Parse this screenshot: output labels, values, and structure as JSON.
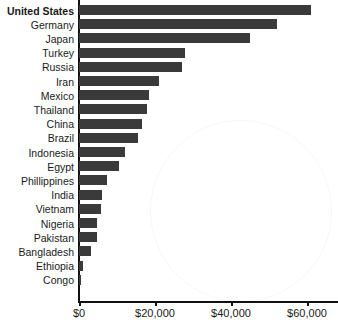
{
  "chart_data": {
    "type": "bar",
    "orientation": "horizontal",
    "title": "",
    "xlabel": "",
    "ylabel": "",
    "xlim": [
      0,
      65000
    ],
    "grid": false,
    "legend": null,
    "tick_labels": [
      "$0",
      "$20,000",
      "$40,000",
      "$60,000"
    ],
    "tick_values": [
      0,
      20000,
      40000,
      60000
    ],
    "bar_color": "#3a3a3a",
    "highlight_category": "United States",
    "categories": [
      "United States",
      "Germany",
      "Japan",
      "Turkey",
      "Russia",
      "Iran",
      "Mexico",
      "Thailand",
      "China",
      "Brazil",
      "Indonesia",
      "Egypt",
      "Phillippines",
      "India",
      "Vietnam",
      "Nigeria",
      "Pakistan",
      "Bangladesh",
      "Ethiopia",
      "Congo"
    ],
    "values": [
      61000,
      52000,
      45000,
      28000,
      27000,
      21000,
      18500,
      18000,
      16500,
      15500,
      12000,
      10500,
      7400,
      6100,
      5800,
      4800,
      4700,
      3200,
      1100,
      550
    ]
  }
}
